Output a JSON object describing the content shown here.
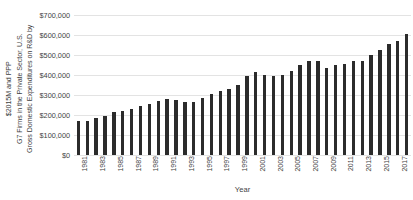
{
  "chart_data": {
    "type": "bar",
    "title": "",
    "xlabel": "Year",
    "ylabel": "Gross Domestic Expenditures on R&D by G7 Firms in the Private Sector, U.S. $2015M and PPP",
    "ylabel_lines": [
      "Gross Domestic Expenditures on R&D by",
      "G7 Firms in the Private Sector, U.S.",
      "$2015M and PPP"
    ],
    "ylim": [
      0,
      700000
    ],
    "ytick_values": [
      0,
      100000,
      200000,
      300000,
      400000,
      500000,
      600000,
      700000
    ],
    "ytick_labels": [
      "$0",
      "$100,000",
      "$200,000",
      "$300,000",
      "$400,000",
      "$500,000",
      "$600,000",
      "$700,000"
    ],
    "grid": true,
    "legend": "none",
    "bar_color": "#2b2b2b",
    "gridline_color": "#e3e3e3",
    "categories": [
      "1981",
      "1982",
      "1983",
      "1984",
      "1985",
      "1986",
      "1987",
      "1988",
      "1989",
      "1990",
      "1991",
      "1992",
      "1993",
      "1994",
      "1995",
      "1996",
      "1997",
      "1998",
      "1999",
      "2000",
      "2001",
      "2002",
      "2003",
      "2004",
      "2005",
      "2006",
      "2007",
      "2008",
      "2009",
      "2010",
      "2011",
      "2012",
      "2013",
      "2014",
      "2015",
      "2016",
      "2017",
      "2018"
    ],
    "xtick_labels": [
      "1981",
      "1983",
      "1985",
      "1987",
      "1989",
      "1991",
      "1993",
      "1995",
      "1997",
      "1999",
      "2001",
      "2003",
      "2005",
      "2007",
      "2009",
      "2011",
      "2013",
      "2015",
      "2017"
    ],
    "values": [
      172000,
      171000,
      186000,
      196000,
      217000,
      219000,
      229000,
      245000,
      257000,
      269000,
      279000,
      273000,
      263000,
      266000,
      286000,
      305000,
      320000,
      330000,
      349000,
      393000,
      415000,
      399000,
      397000,
      399000,
      421000,
      450000,
      471000,
      471000,
      436000,
      448000,
      454000,
      470000,
      472000,
      499000,
      527000,
      553000,
      568000,
      603000
    ]
  }
}
